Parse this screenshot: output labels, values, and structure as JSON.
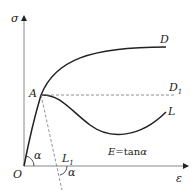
{
  "diagram": {
    "type": "stress-strain curve",
    "axes": {
      "y_label": "σ",
      "x_label": "ε",
      "origin_label": "O"
    },
    "points": {
      "A": "A",
      "D": "D",
      "D1_main": "D",
      "D1_sub": "1",
      "L": "L",
      "L1_main": "L",
      "L1_sub": "1"
    },
    "angle_label": "α",
    "angle_label_2": "α",
    "equation": {
      "E": "E",
      "eq": "=tan",
      "alpha": "α"
    },
    "colors": {
      "line": "#222222",
      "axis": "#777777",
      "dashed": "#666666"
    }
  }
}
